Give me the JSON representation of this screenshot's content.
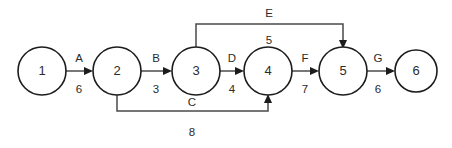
{
  "diagram": {
    "type": "activity-on-arrow-network",
    "background_color": "#ffffff",
    "node_stroke_color": "#1c1c1c",
    "edge_stroke_color": "#4a4a4a",
    "text_color": "#2b2b2b",
    "nodes": [
      {
        "id": "1",
        "label": "1",
        "cx": 42,
        "cy": 71,
        "r": 24
      },
      {
        "id": "2",
        "label": "2",
        "cx": 117,
        "cy": 71,
        "r": 24
      },
      {
        "id": "3",
        "label": "3",
        "cx": 196,
        "cy": 71,
        "r": 24
      },
      {
        "id": "4",
        "label": "4",
        "cx": 268,
        "cy": 71,
        "r": 24
      },
      {
        "id": "5",
        "label": "5",
        "cx": 343,
        "cy": 71,
        "r": 24
      },
      {
        "id": "6",
        "label": "6",
        "cx": 416,
        "cy": 71,
        "r": 21
      }
    ],
    "edges": [
      {
        "id": "edge-a",
        "name": "A",
        "weight": "6",
        "from": "1",
        "to": "2",
        "shape": "straight",
        "name_x": 79,
        "name_y": 59,
        "weight_x": 79,
        "weight_y": 90
      },
      {
        "id": "edge-b",
        "name": "B",
        "weight": "3",
        "from": "2",
        "to": "3",
        "shape": "straight",
        "name_x": 156,
        "name_y": 59,
        "weight_x": 156,
        "weight_y": 90
      },
      {
        "id": "edge-c",
        "name": "C",
        "weight": "8",
        "from": "2",
        "to": "4",
        "shape": "bottom-bypass",
        "name_x": 192,
        "name_y": 103,
        "weight_x": 192,
        "weight_y": 133
      },
      {
        "id": "edge-d",
        "name": "D",
        "weight": "4",
        "from": "3",
        "to": "4",
        "shape": "straight",
        "name_x": 232,
        "name_y": 59,
        "weight_x": 232,
        "weight_y": 90
      },
      {
        "id": "edge-e",
        "name": "E",
        "weight": "5",
        "from": "3",
        "to": "5",
        "shape": "top-bypass",
        "name_x": 269,
        "name_y": 14,
        "weight_x": 269,
        "weight_y": 41
      },
      {
        "id": "edge-f",
        "name": "F",
        "weight": "7",
        "from": "4",
        "to": "5",
        "shape": "straight",
        "name_x": 305,
        "name_y": 59,
        "weight_x": 305,
        "weight_y": 90
      },
      {
        "id": "edge-g",
        "name": "G",
        "weight": "6",
        "from": "5",
        "to": "6",
        "shape": "straight",
        "name_x": 378,
        "name_y": 59,
        "weight_x": 378,
        "weight_y": 90
      }
    ]
  }
}
